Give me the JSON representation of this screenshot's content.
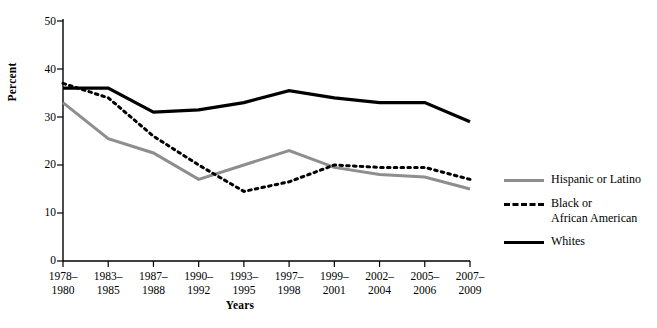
{
  "chart_data": {
    "type": "line",
    "title": "",
    "xlabel": "Years",
    "ylabel": "Percent",
    "ylim": [
      0,
      50
    ],
    "yticks": [
      0,
      10,
      20,
      30,
      40,
      50
    ],
    "grid": false,
    "legend_position": "right",
    "categories": [
      "1978–\n1980",
      "1983–\n1985",
      "1987–\n1988",
      "1990–\n1992",
      "1993–\n1995",
      "1997–\n1998",
      "1999–\n2001",
      "2002–\n2004",
      "2005–\n2006",
      "2007–\n2009"
    ],
    "series": [
      {
        "name": "Hispanic or Latino",
        "style": "solid",
        "color": "#8e8e8e",
        "values": [
          33,
          25.5,
          22.5,
          17,
          20,
          23,
          19.5,
          18,
          17.5,
          15
        ]
      },
      {
        "name": "Black or\nAfrican American",
        "style": "dotted",
        "color": "#000000",
        "values": [
          37,
          34,
          26,
          20,
          14.5,
          16.5,
          20,
          19.5,
          19.5,
          17
        ]
      },
      {
        "name": "Whites",
        "style": "solid",
        "color": "#000000",
        "values": [
          36,
          36,
          31,
          31.5,
          33,
          35.5,
          34,
          33,
          33,
          29
        ]
      }
    ]
  },
  "legend": {
    "items": [
      {
        "label": "Hispanic or Latino",
        "key": "line-gray-solid"
      },
      {
        "label": "Black or\nAfrican American",
        "key": "line-black-dashed"
      },
      {
        "label": "Whites",
        "key": "line-black-solid"
      }
    ]
  },
  "axes": {
    "y_title": "Percent",
    "x_title": "Years",
    "y_tick_labels": [
      "50",
      "40",
      "30",
      "20",
      "10",
      "0"
    ],
    "x_tick_labels": [
      "1978–\n1980",
      "1983–\n1985",
      "1987–\n1988",
      "1990–\n1992",
      "1993–\n1995",
      "1997–\n1998",
      "1999–\n2001",
      "2002–\n2004",
      "2005–\n2006",
      "2007–\n2009"
    ]
  },
  "colors": {
    "axis": "#000000",
    "hispanic": "#8e8e8e",
    "black_african_american": "#000000",
    "whites": "#000000"
  }
}
